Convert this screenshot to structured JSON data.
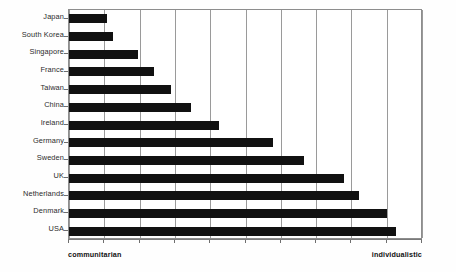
{
  "chart_data": {
    "type": "bar",
    "orientation": "horizontal",
    "title": "",
    "subtitle": "",
    "xlabel": "",
    "ylabel": "",
    "xlim": [
      0,
      10
    ],
    "ylim": null,
    "grid": true,
    "legend": null,
    "legend_position": "none",
    "gridline_count": 11,
    "tick_labels_x": [],
    "axis_endpoint_labels": {
      "left": "communitarian",
      "right": "individualistic"
    },
    "categories": [
      "Japan",
      "South Korea",
      "Singapore",
      "France",
      "Taiwan",
      "China",
      "Ireland",
      "Germany",
      "Sweden",
      "UK",
      "Netherlands",
      "Denmark",
      "USA"
    ],
    "values": [
      1.07,
      1.25,
      1.95,
      2.4,
      2.88,
      3.47,
      4.25,
      5.78,
      6.67,
      7.8,
      8.22,
      9.0,
      9.27
    ],
    "bar_color": "#111111",
    "gridline_color": "#9a9a9a",
    "axis_color": "#8d8d8d",
    "background_color": "#ffffff"
  }
}
